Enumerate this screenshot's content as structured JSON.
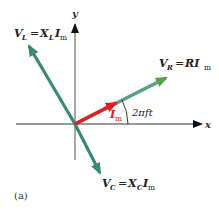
{
  "figure": {
    "caption": "(a)",
    "axes": {
      "x_label": "x",
      "y_label": "y"
    },
    "phasors": {
      "V_L": {
        "sym": "V",
        "sub": "L",
        "eq": "=",
        "rhs": "X",
        "rhs_sub": "L",
        "rhs2": "I",
        "rhs2_sub": "m"
      },
      "V_R": {
        "sym": "V",
        "sub": "R",
        "eq": "=",
        "rhs": "RI",
        "rhs2_sub": "m"
      },
      "V_C": {
        "sym": "V",
        "sub": "C",
        "eq": "=",
        "rhs": "X",
        "rhs_sub": "C",
        "rhs2": "I",
        "rhs2_sub": "m"
      },
      "I_m": {
        "sym": "I",
        "sub": "m"
      }
    },
    "angle_label": "2πft",
    "colors": {
      "voltage_phasor": "#3a8a6e",
      "voltage_phasor_highlight": "#6aa84f",
      "current_phasor": "#e02020",
      "axis": "#666666"
    }
  }
}
